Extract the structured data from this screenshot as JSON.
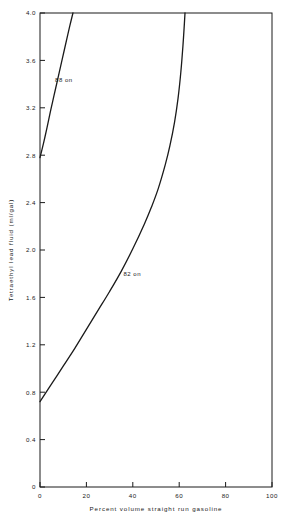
{
  "chart_data": {
    "type": "line",
    "title": "",
    "xlabel": "Percent volume straight run gasoline",
    "ylabel": "Tetraethyl lead fluid (ml/gal)",
    "xlim": [
      0,
      100
    ],
    "ylim": [
      0,
      4.0
    ],
    "xticks": [
      0,
      20,
      40,
      60,
      80,
      100
    ],
    "xticklabels": [
      "0",
      "20",
      "40",
      "60",
      "80",
      "100"
    ],
    "yticks": [
      0,
      0.4,
      0.8,
      1.2,
      1.6,
      2.0,
      2.4,
      2.8,
      3.2,
      3.6,
      4.0
    ],
    "yticklabels": [
      "0",
      "0.4",
      "0.8",
      "1.2",
      "1.6",
      "2.0",
      "2.4",
      "2.8",
      "3.2",
      "3.6",
      "4.0"
    ],
    "grid": false,
    "legend_position": "inline-labels",
    "series": [
      {
        "name": "88 on",
        "label": "88 on",
        "label_x": 6.5,
        "label_y": 3.42,
        "points": [
          [
            0,
            2.78
          ],
          [
            1.5,
            2.9
          ],
          [
            3.0,
            3.03
          ],
          [
            4.5,
            3.17
          ],
          [
            6.0,
            3.3
          ],
          [
            7.5,
            3.43
          ],
          [
            9.0,
            3.56
          ],
          [
            10.5,
            3.69
          ],
          [
            12.0,
            3.82
          ],
          [
            13.2,
            3.92
          ],
          [
            14.2,
            4.0
          ]
        ]
      },
      {
        "name": "82 on",
        "label": "82 on",
        "label_x": 36.0,
        "label_y": 1.78,
        "points": [
          [
            0,
            0.72
          ],
          [
            5,
            0.87
          ],
          [
            10,
            1.02
          ],
          [
            15,
            1.17
          ],
          [
            20,
            1.33
          ],
          [
            25,
            1.49
          ],
          [
            30,
            1.65
          ],
          [
            35,
            1.82
          ],
          [
            40,
            2.01
          ],
          [
            45,
            2.22
          ],
          [
            48,
            2.36
          ],
          [
            51,
            2.52
          ],
          [
            54,
            2.72
          ],
          [
            56,
            2.88
          ],
          [
            58,
            3.08
          ],
          [
            59.5,
            3.28
          ],
          [
            60.7,
            3.5
          ],
          [
            61.6,
            3.72
          ],
          [
            62.2,
            3.9
          ],
          [
            62.5,
            4.0
          ]
        ]
      }
    ]
  }
}
